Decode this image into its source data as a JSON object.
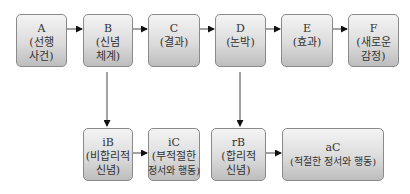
{
  "diagram": {
    "top_row": [
      {
        "id": "A",
        "lines": [
          "A",
          "(선행",
          "사건)"
        ]
      },
      {
        "id": "B",
        "lines": [
          "B",
          "(신념",
          "체계)"
        ]
      },
      {
        "id": "C",
        "lines": [
          "C",
          "(결과)"
        ]
      },
      {
        "id": "D",
        "lines": [
          "D",
          "(논박)"
        ]
      },
      {
        "id": "E",
        "lines": [
          "E",
          "(효과)"
        ]
      },
      {
        "id": "F",
        "lines": [
          "F",
          "(새로운",
          "감정)"
        ]
      }
    ],
    "bottom_row": [
      {
        "id": "iB",
        "lines": [
          "iB",
          "(비합리적",
          "신념)"
        ]
      },
      {
        "id": "iC",
        "lines": [
          "iC",
          "(부적절한",
          "정서와 행동)"
        ]
      },
      {
        "id": "rB",
        "lines": [
          "rB",
          "(합리적",
          "신념)"
        ]
      },
      {
        "id": "aC",
        "lines": [
          "aC",
          "(적절한 정서와 행동)"
        ]
      }
    ],
    "edges": [
      [
        "A",
        "B"
      ],
      [
        "B",
        "C"
      ],
      [
        "C",
        "D"
      ],
      [
        "D",
        "E"
      ],
      [
        "E",
        "F"
      ],
      [
        "B",
        "iB"
      ],
      [
        "D",
        "rB"
      ],
      [
        "iB",
        "iC"
      ],
      [
        "rB",
        "aC"
      ]
    ]
  }
}
